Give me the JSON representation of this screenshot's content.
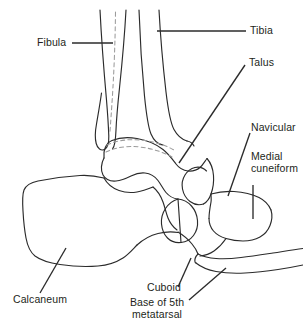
{
  "figure": {
    "kind": "anatomical-line-drawing",
    "background_color": "#ffffff",
    "outline_color": "#2b2b2b",
    "hidden_outline_color": "#9b9b9b",
    "text_color": "#231f20"
  },
  "labels": {
    "fibula": "Fibula",
    "tibia": "Tibia",
    "talus": "Talus",
    "navicular": "Navicular",
    "medial_cuneiform_line1": "Medial",
    "medial_cuneiform_line2": "cuneiform",
    "calcaneum": "Calcaneum",
    "cuboid": "Cuboid",
    "base_fifth_line1": "Base of 5th",
    "base_fifth_line2": "metatarsal"
  }
}
